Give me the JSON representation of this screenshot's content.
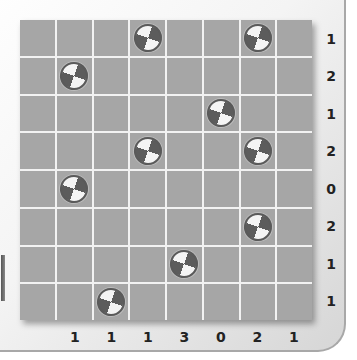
{
  "game": {
    "rows": 8,
    "cols": 8,
    "row_clues": [
      "1",
      "2",
      "1",
      "2",
      "0",
      "2",
      "1",
      "1"
    ],
    "col_clues": [
      "",
      "1",
      "1",
      "1",
      "3",
      "0",
      "2",
      "1"
    ],
    "tokens": [
      {
        "row": 0,
        "col": 3
      },
      {
        "row": 0,
        "col": 6
      },
      {
        "row": 1,
        "col": 1
      },
      {
        "row": 2,
        "col": 5
      },
      {
        "row": 3,
        "col": 3
      },
      {
        "row": 3,
        "col": 6
      },
      {
        "row": 4,
        "col": 1
      },
      {
        "row": 5,
        "col": 6
      },
      {
        "row": 6,
        "col": 4
      },
      {
        "row": 7,
        "col": 2
      }
    ],
    "token_icon": "quartered-disc-icon",
    "colors": {
      "cell": "#a6a6a6",
      "grid_line": "#f2f2f2",
      "token_dark": "#5c5c5c",
      "token_light": "#f4f4f4",
      "clue_text": "#222222"
    }
  }
}
